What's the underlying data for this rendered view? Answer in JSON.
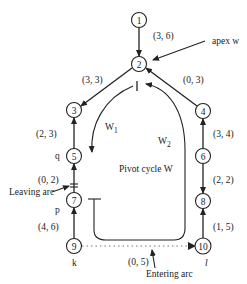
{
  "diagram": {
    "title": "Pivot cycle W",
    "nodes": [
      {
        "id": "1",
        "x": 139,
        "y": 20
      },
      {
        "id": "2",
        "x": 139,
        "y": 64
      },
      {
        "id": "3",
        "x": 74,
        "y": 110
      },
      {
        "id": "4",
        "x": 203,
        "y": 111
      },
      {
        "id": "5",
        "x": 74,
        "y": 156
      },
      {
        "id": "6",
        "x": 203,
        "y": 156
      },
      {
        "id": "7",
        "x": 74,
        "y": 200
      },
      {
        "id": "8",
        "x": 203,
        "y": 201
      },
      {
        "id": "9",
        "x": 74,
        "y": 246
      },
      {
        "id": "10",
        "x": 203,
        "y": 246
      }
    ],
    "edges": [
      {
        "from": "1",
        "to": "2",
        "label": "(3, 6)"
      },
      {
        "from": "2",
        "to": "3",
        "label": "(3, 3)"
      },
      {
        "from": "4",
        "to": "2",
        "label": "(0, 3)"
      },
      {
        "from": "5",
        "to": "3",
        "label": "(2, 3)"
      },
      {
        "from": "6",
        "to": "4",
        "label": "(3, 4)"
      },
      {
        "from": "7",
        "to": "5",
        "label": "(0, 2)"
      },
      {
        "from": "6",
        "to": "8",
        "label": "(2, 2)"
      },
      {
        "from": "9",
        "to": "7",
        "label": "(4, 6)"
      },
      {
        "from": "10",
        "to": "8",
        "label": "(1, 5)"
      },
      {
        "from": "9",
        "to": "10",
        "label": "(0, 5)",
        "style": "dotted"
      }
    ],
    "annotations": {
      "apex": "apex w",
      "w1": "W",
      "w1_sub": "1",
      "w2": "W",
      "w2_sub": "2",
      "pivot_cycle": "Pivot cycle W",
      "leaving_arc": "Leaving arc",
      "entering_arc": "Entering arc",
      "node_q": "q",
      "node_p": "p",
      "node_k": "k",
      "node_l": "l"
    }
  }
}
